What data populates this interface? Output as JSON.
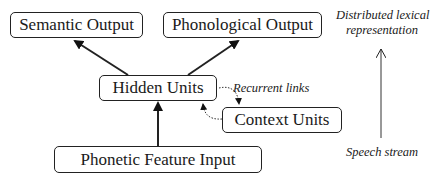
{
  "diagram": {
    "nodes": {
      "semantic_output": "Semantic Output",
      "phonological_output": "Phonological Output",
      "hidden_units": "Hidden Units",
      "context_units": "Context Units",
      "phonetic_feature_input": "Phonetic Feature Input"
    },
    "annotations": {
      "recurrent_links": "Recurrent links",
      "top_label_line1": "Distributed lexical",
      "top_label_line2": "representation",
      "bottom_label": "Speech stream"
    },
    "edges": [
      {
        "from": "phonetic_feature_input",
        "to": "hidden_units",
        "style": "solid"
      },
      {
        "from": "hidden_units",
        "to": "semantic_output",
        "style": "solid"
      },
      {
        "from": "hidden_units",
        "to": "phonological_output",
        "style": "solid"
      },
      {
        "from": "hidden_units",
        "to": "context_units",
        "style": "dotted"
      },
      {
        "from": "context_units",
        "to": "hidden_units",
        "style": "dotted"
      },
      {
        "from": "speech_stream",
        "to": "distributed_lexical_representation",
        "style": "thin-arrow"
      }
    ]
  }
}
